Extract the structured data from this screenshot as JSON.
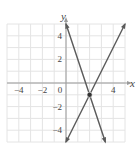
{
  "chart_data": {
    "type": "line",
    "title": "",
    "xlabel": "x",
    "ylabel": "y",
    "xlim": [
      -5,
      5
    ],
    "ylim": [
      -5,
      5
    ],
    "grid": true,
    "x_ticks": [
      -4,
      -2,
      0,
      4
    ],
    "y_ticks": [
      4,
      2,
      -2,
      -4
    ],
    "tick_labels": {
      "x": [
        "−4",
        "−2",
        "0",
        "4"
      ],
      "y": [
        "4",
        "2",
        "−2",
        "−4"
      ]
    },
    "series": [
      {
        "name": "line 1",
        "equation": "y = -3x + 5",
        "x": [
          0,
          3.333
        ],
        "y": [
          5,
          -5
        ]
      },
      {
        "name": "line 2",
        "equation": "y = 2x - 5",
        "x": [
          0,
          5
        ],
        "y": [
          -5,
          5
        ]
      }
    ],
    "annotations": [
      {
        "type": "point",
        "x": 2,
        "y": -1,
        "label": "intersection"
      }
    ]
  }
}
